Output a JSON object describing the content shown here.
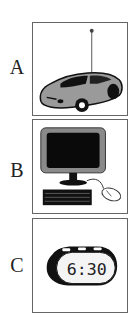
{
  "options": [
    {
      "label": "A",
      "icon": "toy-car-icon"
    },
    {
      "label": "B",
      "icon": "desktop-computer-icon"
    },
    {
      "label": "C",
      "icon": "alarm-clock-icon",
      "clock_text": "6:30"
    }
  ]
}
